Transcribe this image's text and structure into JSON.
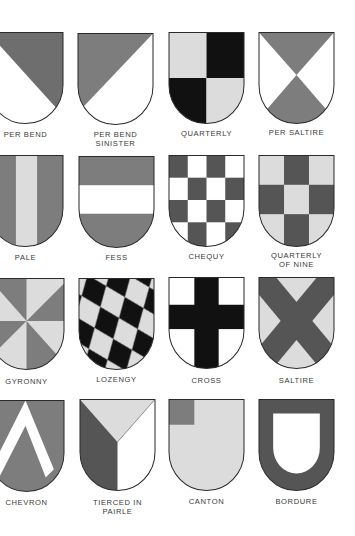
{
  "colors": {
    "dark_grey": "#6e6e6e",
    "mid_grey": "#7d7d7d",
    "light_grey": "#dcdcdc",
    "black": "#111111",
    "white": "#ffffff",
    "outline": "#2a2a2a",
    "label": "#3a3a3a"
  },
  "shields": [
    {
      "id": "per-bend",
      "label": "PER BEND",
      "label_lines": [
        "PER BEND"
      ]
    },
    {
      "id": "per-bend-sinister",
      "label": "PER BEND SINISTER",
      "label_lines": [
        "PER BEND",
        "SINISTER"
      ]
    },
    {
      "id": "quarterly",
      "label": "QUARTERLY",
      "label_lines": [
        "QUARTERLY"
      ]
    },
    {
      "id": "per-saltire",
      "label": "PER SALTIRE",
      "label_lines": [
        "PER SALTIRE"
      ]
    },
    {
      "id": "pale",
      "label": "PALE",
      "label_lines": [
        "PALE"
      ]
    },
    {
      "id": "fess",
      "label": "FESS",
      "label_lines": [
        "FESS"
      ]
    },
    {
      "id": "chequy",
      "label": "CHEQUY",
      "label_lines": [
        "CHEQUY"
      ]
    },
    {
      "id": "quarterly-of-nine",
      "label": "QUARTERLY OF NINE",
      "label_lines": [
        "QUARTERLY",
        "OF NINE"
      ]
    },
    {
      "id": "gyronny",
      "label": "GYRONNY",
      "label_lines": [
        "GYRONNY"
      ]
    },
    {
      "id": "lozengy",
      "label": "LOZENGY",
      "label_lines": [
        "LOZENGY"
      ]
    },
    {
      "id": "cross",
      "label": "CROSS",
      "label_lines": [
        "CROSS"
      ]
    },
    {
      "id": "saltire",
      "label": "SALTIRE",
      "label_lines": [
        "SALTIRE"
      ]
    },
    {
      "id": "chevron",
      "label": "CHEVRON",
      "label_lines": [
        "CHEVRON"
      ]
    },
    {
      "id": "tierced-in-pairle",
      "label": "TIERCED IN PAIRLE",
      "label_lines": [
        "TIERCED IN",
        "PAIRLE"
      ]
    },
    {
      "id": "canton",
      "label": "CANTON",
      "label_lines": [
        "CANTON"
      ]
    },
    {
      "id": "bordure",
      "label": "BORDURE",
      "label_lines": [
        "BORDURE"
      ]
    }
  ]
}
